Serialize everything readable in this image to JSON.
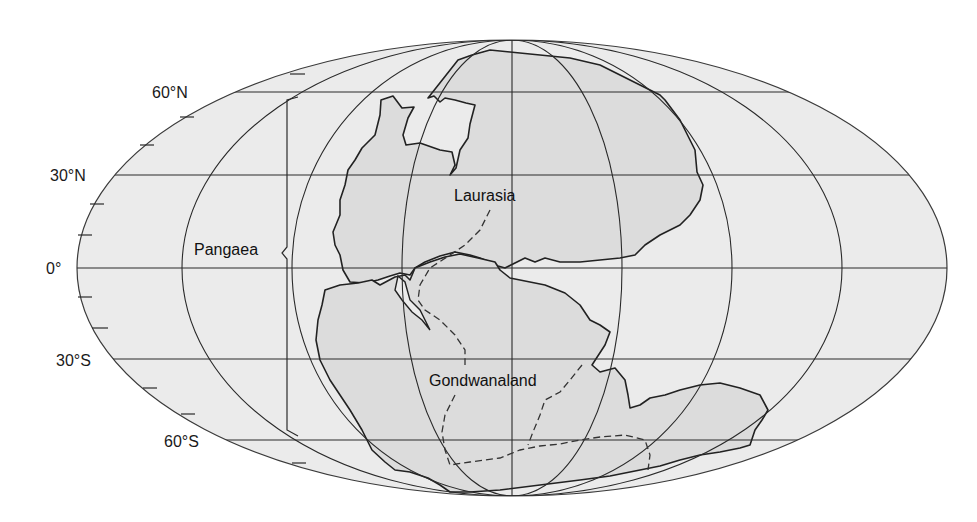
{
  "map": {
    "projection": "Mollweide (equal-area ellipse)",
    "ocean_fill": "#ebebeb",
    "land_fill": "#dcdcdc",
    "line_color": "#2a2a2a",
    "latitude_labels": [
      {
        "text": "60°N",
        "lat": 60
      },
      {
        "text": "30°N",
        "lat": 30
      },
      {
        "text": "0°",
        "lat": 0
      },
      {
        "text": "30°S",
        "lat": -30
      },
      {
        "text": "60°S",
        "lat": -60
      }
    ],
    "continent_labels": {
      "supercontinent": "Pangaea",
      "northern": "Laurasia",
      "southern": "Gondwanaland"
    }
  }
}
